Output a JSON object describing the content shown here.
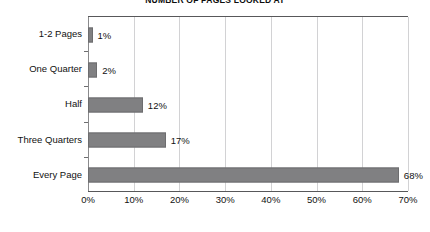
{
  "chart_data": {
    "type": "bar",
    "orientation": "horizontal",
    "title": "NUMBER OF PAGES LOOKED AT",
    "xlabel": "",
    "ylabel": "",
    "categories": [
      "1-2 Pages",
      "One Quarter",
      "Half",
      "Three Quarters",
      "Every Page"
    ],
    "values": [
      1,
      2,
      12,
      17,
      68
    ],
    "value_labels": [
      "1%",
      "2%",
      "12%",
      "17%",
      "68%"
    ],
    "xlim": [
      0,
      70
    ],
    "xticks": [
      0,
      10,
      20,
      30,
      40,
      50,
      60,
      70
    ],
    "xtick_labels": [
      "0%",
      "10%",
      "20%",
      "30%",
      "40%",
      "50%",
      "60%",
      "70%"
    ],
    "grid": "vertical",
    "legend": "none",
    "series": [
      {
        "name": "Percent of respondents",
        "values": [
          1,
          2,
          12,
          17,
          68
        ]
      }
    ],
    "colors": {
      "bar_fill": "#808082",
      "bar_border": "#6d6d6f",
      "gridline": "#d2d2d4",
      "axis": "#58585a",
      "text": "#111111",
      "background": "#ffffff"
    }
  }
}
